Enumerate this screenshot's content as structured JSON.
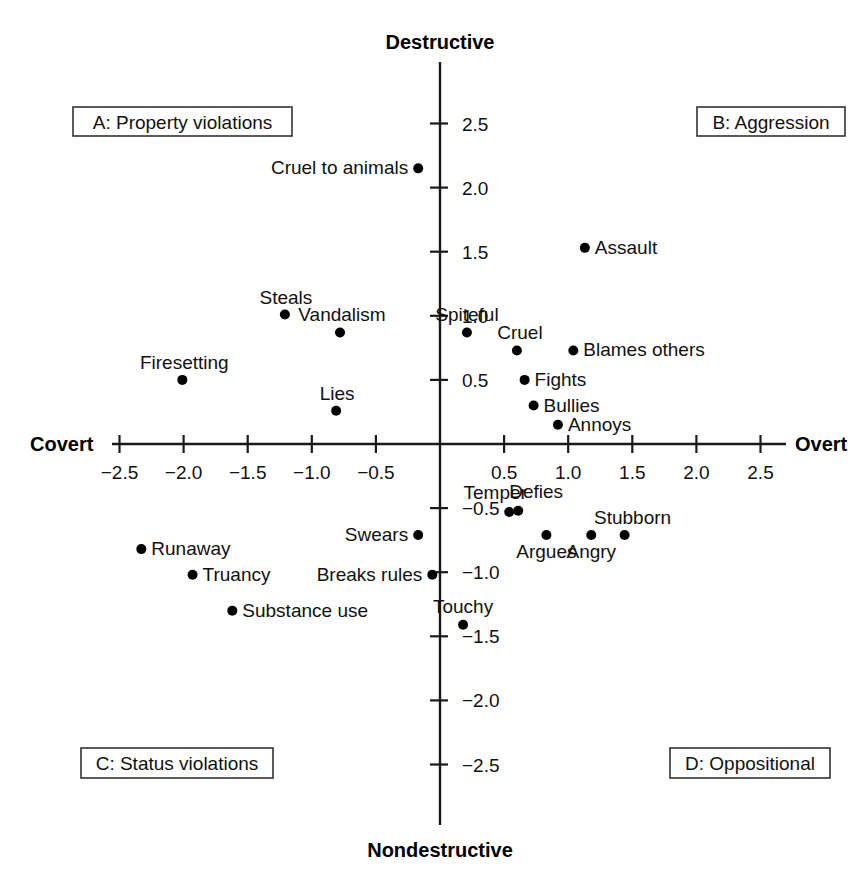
{
  "chart_data": {
    "type": "scatter",
    "title": "",
    "xlabel": "Covert – Overt",
    "ylabel": "Nondestructive – Destructive",
    "xlim": [
      -2.8,
      2.8
    ],
    "ylim": [
      -2.95,
      2.95
    ],
    "grid": false,
    "legend": "none",
    "axis_poles": {
      "top": "Destructive",
      "bottom": "Nondestructive",
      "left": "Covert",
      "right": "Overt"
    },
    "x_ticks": [
      -2.5,
      -2.0,
      -1.5,
      -1.0,
      -0.5,
      0.5,
      1.0,
      1.5,
      2.0,
      2.5
    ],
    "x_tick_labels": [
      "−2.5",
      "−2.0",
      "−1.5",
      "−1.0",
      "−0.5",
      "0.5",
      "1.0",
      "1.5",
      "2.0",
      "2.5"
    ],
    "y_ticks": [
      2.5,
      2.0,
      1.5,
      1.0,
      0.5,
      -0.5,
      -1.0,
      -1.5,
      -2.0,
      -2.5
    ],
    "y_tick_labels": [
      "2.5",
      "2.0",
      "1.5",
      "1.0",
      "0.5",
      "−0.5",
      "−1.0",
      "−1.5",
      "−2.0",
      "−2.5"
    ],
    "points": [
      {
        "label": "Cruel to animals",
        "x": -0.17,
        "y": 2.15,
        "anchor": "end",
        "dx": -10,
        "dy": 6
      },
      {
        "label": "Assault",
        "x": 1.13,
        "y": 1.53,
        "anchor": "start",
        "dx": 10,
        "dy": 6
      },
      {
        "label": "Steals",
        "x": -1.21,
        "y": 1.01,
        "anchor": "middle",
        "dx": 1,
        "dy": -11
      },
      {
        "label": "Vandalism",
        "x": -0.78,
        "y": 0.87,
        "anchor": "middle",
        "dx": 2,
        "dy": -11
      },
      {
        "label": "Spiteful",
        "x": 0.21,
        "y": 0.87,
        "anchor": "middle",
        "dx": 0,
        "dy": -11
      },
      {
        "label": "Cruel",
        "x": 0.6,
        "y": 0.73,
        "anchor": "middle",
        "dx": 3,
        "dy": -11
      },
      {
        "label": "Blames others",
        "x": 1.04,
        "y": 0.73,
        "anchor": "start",
        "dx": 10,
        "dy": 6
      },
      {
        "label": "Firesetting",
        "x": -2.01,
        "y": 0.5,
        "anchor": "middle",
        "dx": 2,
        "dy": -11
      },
      {
        "label": "Fights",
        "x": 0.66,
        "y": 0.5,
        "anchor": "start",
        "dx": 10,
        "dy": 6
      },
      {
        "label": "Bullies",
        "x": 0.73,
        "y": 0.3,
        "anchor": "start",
        "dx": 10,
        "dy": 6
      },
      {
        "label": "Lies",
        "x": -0.81,
        "y": 0.26,
        "anchor": "middle",
        "dx": 1,
        "dy": -11
      },
      {
        "label": "Annoys",
        "x": 0.92,
        "y": 0.15,
        "anchor": "start",
        "dx": 10,
        "dy": 6
      },
      {
        "label": "Temper",
        "x": 0.54,
        "y": -0.53,
        "anchor": "middle",
        "dx": -14,
        "dy": -13
      },
      {
        "label": "Defies",
        "x": 0.61,
        "y": -0.52,
        "anchor": "middle",
        "dx": 18,
        "dy": -13
      },
      {
        "label": "Argues",
        "x": 0.83,
        "y": -0.71,
        "anchor": "middle",
        "dx": 0,
        "dy": 23
      },
      {
        "label": "Angry",
        "x": 1.18,
        "y": -0.71,
        "anchor": "middle",
        "dx": 0,
        "dy": 23
      },
      {
        "label": "Stubborn",
        "x": 1.44,
        "y": -0.71,
        "anchor": "middle",
        "dx": 8,
        "dy": -11
      },
      {
        "label": "Swears",
        "x": -0.17,
        "y": -0.71,
        "anchor": "end",
        "dx": -10,
        "dy": 6
      },
      {
        "label": "Runaway",
        "x": -2.33,
        "y": -0.82,
        "anchor": "start",
        "dx": 10,
        "dy": 6
      },
      {
        "label": "Truancy",
        "x": -1.93,
        "y": -1.02,
        "anchor": "start",
        "dx": 10,
        "dy": 6
      },
      {
        "label": "Breaks rules",
        "x": -0.06,
        "y": -1.02,
        "anchor": "end",
        "dx": -10,
        "dy": 6
      },
      {
        "label": "Substance use",
        "x": -1.62,
        "y": -1.3,
        "anchor": "start",
        "dx": 10,
        "dy": 6
      },
      {
        "label": "Touchy",
        "x": 0.18,
        "y": -1.41,
        "anchor": "middle",
        "dx": 0,
        "dy": -12
      }
    ],
    "quadrants": [
      {
        "id": "A",
        "label": "A: Property violations",
        "corner": "top-left"
      },
      {
        "id": "B",
        "label": "B: Aggression",
        "corner": "top-right"
      },
      {
        "id": "C",
        "label": "C: Status violations",
        "corner": "bottom-left"
      },
      {
        "id": "D",
        "label": "D: Oppositional",
        "corner": "bottom-right"
      }
    ]
  },
  "colors": {
    "background": "#ffffff",
    "axis": "#1a1a1a",
    "point": "#000000",
    "text": "#111111",
    "box_border": "#333333"
  }
}
